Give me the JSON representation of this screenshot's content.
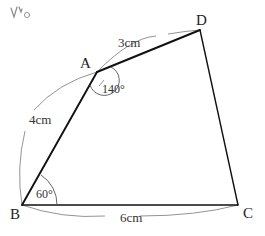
{
  "figure": {
    "type": "geometry-diagram",
    "background_color": "#ffffff",
    "stroke_color": "#1a1a1a",
    "arc_color": "#6b6b6b",
    "vertices": [
      {
        "name": "A",
        "label": "A",
        "x": 97,
        "y": 72,
        "label_x": 80,
        "label_y": 56
      },
      {
        "name": "B",
        "label": "B",
        "x": 22,
        "y": 205,
        "label_x": 10,
        "label_y": 207
      },
      {
        "name": "C",
        "label": "C",
        "x": 238,
        "y": 205,
        "label_x": 243,
        "label_y": 206
      },
      {
        "name": "D",
        "label": "D",
        "x": 200,
        "y": 30,
        "label_x": 196,
        "label_y": 13
      }
    ],
    "edges": [
      {
        "name": "edge-ab",
        "from": "B",
        "to": "A"
      },
      {
        "name": "edge-ad",
        "from": "A",
        "to": "D"
      },
      {
        "name": "edge-dc",
        "from": "D",
        "to": "C"
      },
      {
        "name": "edge-bc",
        "from": "B",
        "to": "C"
      }
    ],
    "measurements": [
      {
        "name": "measure-ad",
        "edge": "AD",
        "text": "3cm",
        "x": 118,
        "y": 36
      },
      {
        "name": "measure-ab",
        "edge": "AB",
        "text": "4cm",
        "x": 29,
        "y": 113
      },
      {
        "name": "measure-bc",
        "edge": "BC",
        "text": "6cm",
        "x": 120,
        "y": 211
      }
    ],
    "angles": [
      {
        "name": "angle-at-a",
        "vertex": "A",
        "text": "140°",
        "x": 102,
        "y": 83
      },
      {
        "name": "angle-at-b",
        "vertex": "B",
        "text": "60°",
        "x": 36,
        "y": 188
      }
    ],
    "annotation": {
      "name": "handwritten-mark",
      "text": "",
      "description": "faint handwritten scribble top-left"
    }
  }
}
